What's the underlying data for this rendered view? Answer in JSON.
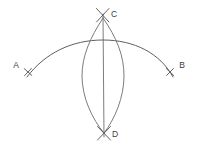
{
  "figure": {
    "background_color": "#ffffff",
    "line_color": "#6d6d6d",
    "label_color": "#3d3d3d",
    "width": 198,
    "height": 151
  },
  "labels": {
    "a": "A",
    "b": "B",
    "c": "C",
    "d": "D"
  },
  "points": [
    {
      "name": "A",
      "label": "A",
      "x": 28,
      "y": 72,
      "label_x": 16,
      "label_y": 65
    },
    {
      "name": "B",
      "label": "B",
      "x": 170,
      "y": 72,
      "label_x": 180,
      "label_y": 65
    },
    {
      "name": "C",
      "label": "C",
      "x": 103,
      "y": 17,
      "label_x": 111,
      "label_y": 15
    },
    {
      "name": "D",
      "label": "D",
      "x": 104,
      "y": 133,
      "label_x": 112,
      "label_y": 134
    }
  ],
  "geometry": {
    "main_arc": {
      "type": "arc",
      "start_x": 28,
      "start_y": 76,
      "end_x": 172,
      "end_y": 76,
      "apex_x": 103,
      "apex_y": 40
    },
    "lens_left_arc": {
      "type": "arc",
      "start_x": 103,
      "start_y": 17,
      "end_x": 104,
      "end_y": 133,
      "bulge_x": 82,
      "bulge_y": 75
    },
    "lens_right_arc": {
      "type": "arc",
      "start_x": 103,
      "start_y": 17,
      "end_x": 104,
      "end_y": 133,
      "bulge_x": 124,
      "bulge_y": 75
    },
    "center_line": {
      "type": "line",
      "x1": 103,
      "y1": 14,
      "x2": 104,
      "y2": 136
    }
  },
  "tick_marks": [
    {
      "name": "tick-a",
      "cx": 28,
      "cy": 72,
      "size": 5.5,
      "rotation": 20
    },
    {
      "name": "tick-b",
      "cx": 170,
      "cy": 72,
      "size": 5.5,
      "rotation": -20
    },
    {
      "name": "tick-c",
      "cx": 103,
      "cy": 16,
      "size": 6.5,
      "rotation": 0
    },
    {
      "name": "tick-d",
      "cx": 104,
      "cy": 133,
      "size": 6.5,
      "rotation": 0
    }
  ]
}
